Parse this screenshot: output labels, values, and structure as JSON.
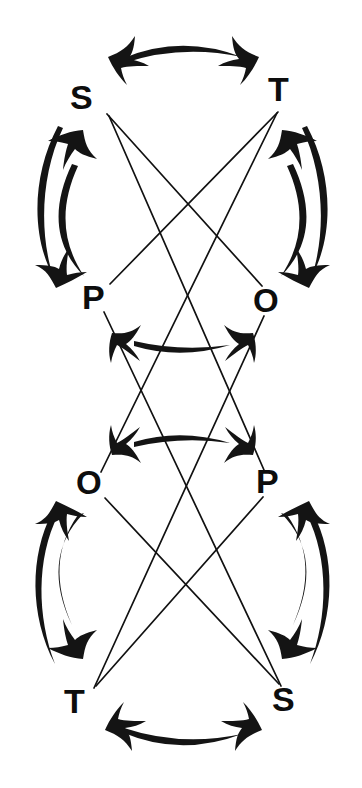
{
  "figure": {
    "ink_color": "#141414",
    "background_color": "#ffffff",
    "width": 362,
    "height": 788
  },
  "nodes": [
    {
      "id": "s-top",
      "label": "S",
      "x": 93,
      "y": 100,
      "group": "upper"
    },
    {
      "id": "t-top",
      "label": "T",
      "x": 286,
      "y": 93,
      "group": "upper"
    },
    {
      "id": "p-upper",
      "label": "P",
      "x": 97,
      "y": 298,
      "group": "upper"
    },
    {
      "id": "o-upper",
      "label": "O",
      "x": 270,
      "y": 302,
      "group": "upper"
    },
    {
      "id": "o-lower",
      "label": "O",
      "x": 93,
      "y": 484,
      "group": "lower"
    },
    {
      "id": "p-lower",
      "label": "P",
      "x": 271,
      "y": 482,
      "group": "lower"
    },
    {
      "id": "t-bottom",
      "label": "T",
      "x": 82,
      "y": 702,
      "group": "lower"
    },
    {
      "id": "s-bottom",
      "label": "S",
      "x": 287,
      "y": 700,
      "group": "lower"
    }
  ],
  "arcs": [
    {
      "id": "arc-s-t-top",
      "from": "s-top",
      "to": "t-top",
      "style": "double-headed",
      "orientation": "horizontal-top"
    },
    {
      "id": "arc-s-p-left",
      "from": "s-top",
      "to": "p-upper",
      "style": "double-headed",
      "orientation": "vertical-left"
    },
    {
      "id": "arc-t-o-right",
      "from": "t-top",
      "to": "o-upper",
      "style": "double-headed",
      "orientation": "vertical-right"
    },
    {
      "id": "arc-p-o-middle",
      "from": "p-upper",
      "to": "o-upper",
      "style": "double-headed",
      "orientation": "horizontal-middle-upper"
    },
    {
      "id": "arc-o-p-middle",
      "from": "o-lower",
      "to": "p-lower",
      "style": "double-headed",
      "orientation": "horizontal-middle-lower"
    },
    {
      "id": "arc-o-t-left",
      "from": "o-lower",
      "to": "t-bottom",
      "style": "double-headed",
      "orientation": "vertical-left"
    },
    {
      "id": "arc-p-s-right",
      "from": "p-lower",
      "to": "s-bottom",
      "style": "double-headed",
      "orientation": "vertical-right"
    },
    {
      "id": "arc-t-s-bottom",
      "from": "t-bottom",
      "to": "s-bottom",
      "style": "double-headed",
      "orientation": "horizontal-bottom"
    }
  ],
  "lines": [
    {
      "id": "line-s-o-upper",
      "from": "s-top",
      "to": "o-upper"
    },
    {
      "id": "line-t-p-upper",
      "from": "t-top",
      "to": "p-upper"
    },
    {
      "id": "line-s-p-lower",
      "from": "s-top",
      "to": "p-lower"
    },
    {
      "id": "line-t-o-lower",
      "from": "t-top",
      "to": "o-lower"
    },
    {
      "id": "line-o-s-lower",
      "from": "o-lower",
      "to": "s-bottom"
    },
    {
      "id": "line-p-t-lower",
      "from": "p-lower",
      "to": "t-bottom"
    },
    {
      "id": "line-p-upper-s",
      "from": "p-upper",
      "to": "s-bottom"
    },
    {
      "id": "line-o-upper-t",
      "from": "o-upper",
      "to": "t-bottom"
    }
  ],
  "crossing_point": {
    "x": 181,
    "y": 394
  },
  "labels": {
    "s_top": "S",
    "t_top": "T",
    "p_upper": "P",
    "o_upper": "O",
    "o_lower": "O",
    "p_lower": "P",
    "t_bottom": "T",
    "s_bottom": "S"
  }
}
